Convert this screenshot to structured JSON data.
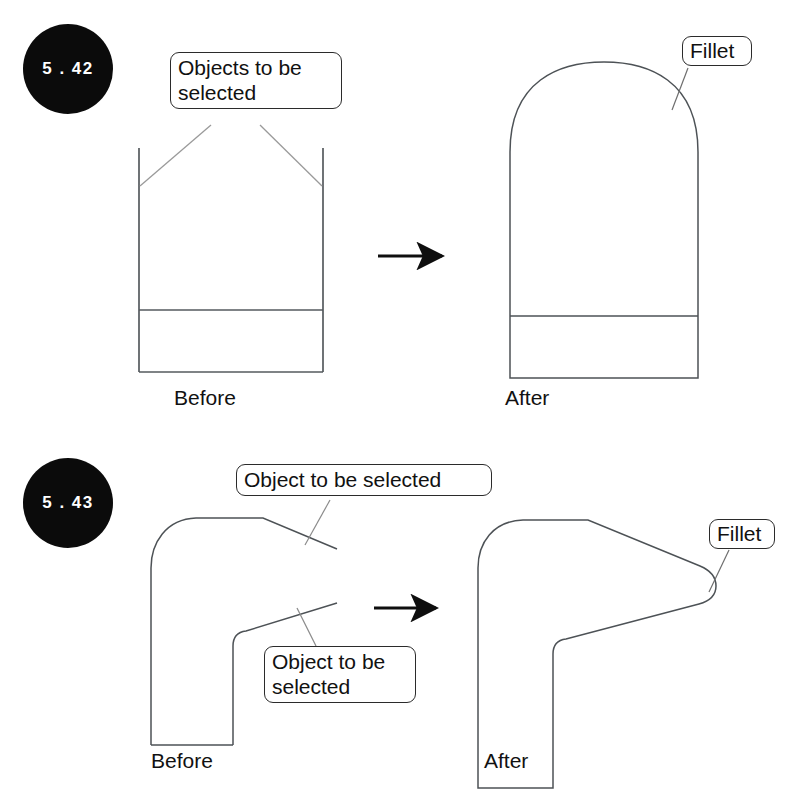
{
  "page": {
    "width": 796,
    "height": 805,
    "background": "#ffffff",
    "ink_color": "#2b2b2b",
    "badge_color": "#0b0b0b",
    "badge_text_color": "#ffffff",
    "header_ghost_text": ""
  },
  "figures": [
    {
      "id": "fig-5-42",
      "number": "5 . 42",
      "callouts": [
        {
          "name": "objects-to-be-selected",
          "text": "Objects to be\nselected"
        },
        {
          "name": "fillet",
          "text": "Fillet"
        }
      ],
      "captions": {
        "before": "Before",
        "after": "After"
      }
    },
    {
      "id": "fig-5-43",
      "number": "5 . 43",
      "callouts": [
        {
          "name": "object-to-be-selected-top",
          "text": "Object to be selected"
        },
        {
          "name": "object-to-be-selected-bottom",
          "text": "Object to be\nselected"
        },
        {
          "name": "fillet",
          "text": "Fillet"
        }
      ],
      "captions": {
        "before": "Before",
        "after": "After"
      }
    }
  ]
}
